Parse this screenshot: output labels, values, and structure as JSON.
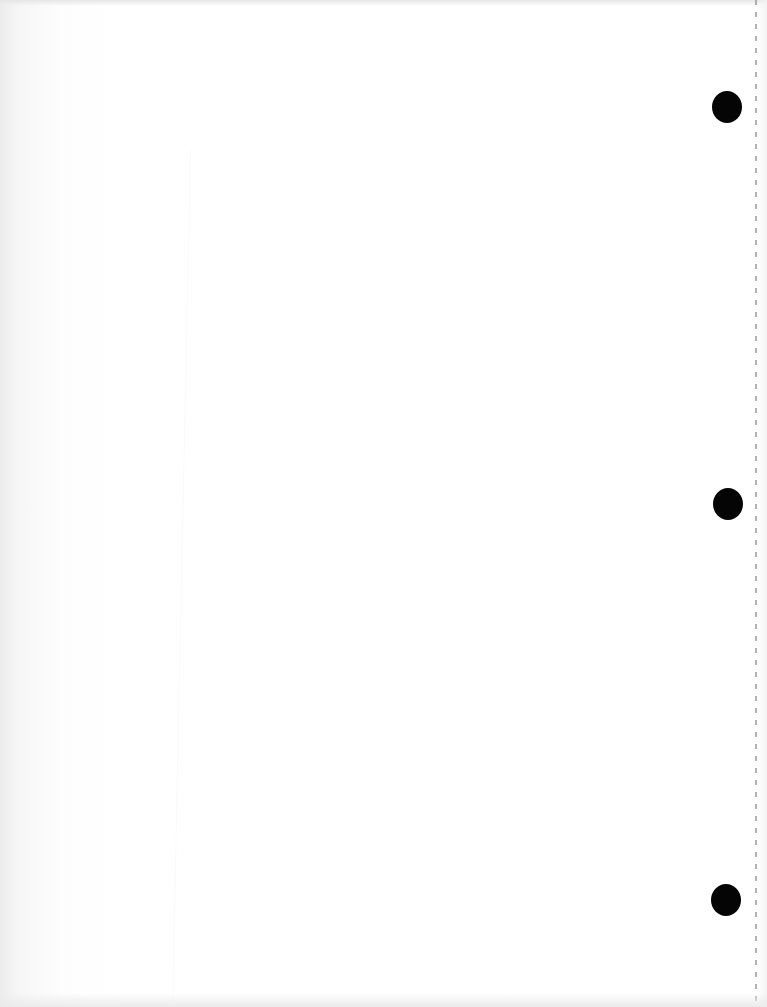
{
  "document": {
    "type": "blank-scanned-page",
    "background_color": "#ffffff",
    "hole_color": "#050505",
    "perforation_color": "#9a9a9a",
    "holes": [
      {
        "id": "top",
        "cx": 727,
        "cy": 107
      },
      {
        "id": "middle",
        "cx": 728,
        "cy": 504
      },
      {
        "id": "bottom",
        "cx": 726,
        "cy": 900
      }
    ]
  }
}
